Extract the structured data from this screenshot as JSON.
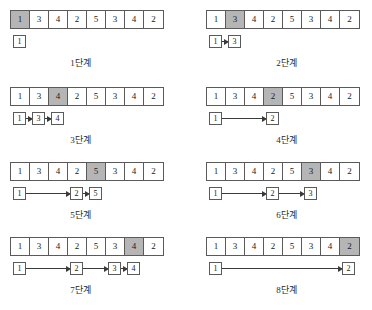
{
  "figure": {
    "title": "",
    "array_values": [
      "1",
      "3",
      "4",
      "2",
      "5",
      "3",
      "4",
      "2"
    ],
    "cell_width_px": 19,
    "highlight_color": "#b5b5b5",
    "panels": [
      {
        "caption": "1단계",
        "highlight_index": 0,
        "chain": [
          {
            "label": "1",
            "index": 0
          }
        ],
        "links": []
      },
      {
        "caption": "2단계",
        "highlight_index": 1,
        "chain": [
          {
            "label": "1",
            "index": 0
          },
          {
            "label": "3",
            "index": 1
          }
        ],
        "links": [
          {
            "from": 0,
            "to": 1
          }
        ]
      },
      {
        "caption": "3단계",
        "highlight_index": 2,
        "chain": [
          {
            "label": "1",
            "index": 0
          },
          {
            "label": "3",
            "index": 1
          },
          {
            "label": "4",
            "index": 2
          }
        ],
        "links": [
          {
            "from": 0,
            "to": 1
          },
          {
            "from": 1,
            "to": 2
          }
        ]
      },
      {
        "caption": "4단계",
        "highlight_index": 3,
        "chain": [
          {
            "label": "1",
            "index": 0
          },
          {
            "label": "2",
            "index": 3
          }
        ],
        "links": [
          {
            "from": 0,
            "to": 3
          }
        ]
      },
      {
        "caption": "5단계",
        "highlight_index": 4,
        "chain": [
          {
            "label": "1",
            "index": 0
          },
          {
            "label": "2",
            "index": 3
          },
          {
            "label": "5",
            "index": 4
          }
        ],
        "links": [
          {
            "from": 0,
            "to": 3
          },
          {
            "from": 3,
            "to": 4
          }
        ]
      },
      {
        "caption": "6단계",
        "highlight_index": 5,
        "chain": [
          {
            "label": "1",
            "index": 0
          },
          {
            "label": "2",
            "index": 3
          },
          {
            "label": "3",
            "index": 5
          }
        ],
        "links": [
          {
            "from": 0,
            "to": 3
          },
          {
            "from": 3,
            "to": 5
          }
        ]
      },
      {
        "caption": "7단계",
        "highlight_index": 6,
        "chain": [
          {
            "label": "1",
            "index": 0
          },
          {
            "label": "2",
            "index": 3
          },
          {
            "label": "3",
            "index": 5
          },
          {
            "label": "4",
            "index": 6
          }
        ],
        "links": [
          {
            "from": 0,
            "to": 3
          },
          {
            "from": 3,
            "to": 5
          },
          {
            "from": 5,
            "to": 6
          }
        ]
      },
      {
        "caption": "8단계",
        "highlight_index": 7,
        "chain": [
          {
            "label": "1",
            "index": 0
          },
          {
            "label": "2",
            "index": 7
          }
        ],
        "links": [
          {
            "from": 0,
            "to": 7
          }
        ]
      }
    ]
  }
}
